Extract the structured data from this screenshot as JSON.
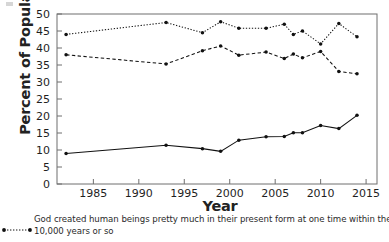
{
  "chart_data": {
    "type": "line",
    "title": "",
    "xlabel": "Year",
    "ylabel": "Percent of Population",
    "xlim": [
      1981,
      2016.2
    ],
    "ylim": [
      0,
      50
    ],
    "xticks": [
      1985,
      1990,
      1995,
      2000,
      2005,
      2010,
      2015
    ],
    "yticks": [
      0,
      5,
      10,
      15,
      20,
      25,
      30,
      35,
      40,
      45,
      50
    ],
    "grid": false,
    "legend_position": "below-left",
    "series": [
      {
        "name": "God created human beings pretty much in their present form at one time within the last 10,000 years or so",
        "style": "dotted",
        "marker": "filled-circle",
        "color": "#111111",
        "x": [
          1982,
          1993,
          1997,
          1999,
          2001,
          2004,
          2006,
          2007,
          2008,
          2010,
          2012,
          2014
        ],
        "values": [
          44.0,
          47.5,
          44.5,
          47.7,
          45.8,
          45.8,
          47.0,
          44.0,
          45.0,
          41.2,
          47.2,
          43.3
        ]
      },
      {
        "name": "Human beings have developed over millions of years from less advanced forms of life, but God guided this process",
        "style": "dashed",
        "marker": "filled-circle",
        "color": "#111111",
        "x": [
          1982,
          1993,
          1997,
          1999,
          2001,
          2004,
          2006,
          2007,
          2008,
          2010,
          2012,
          2014
        ],
        "values": [
          38.0,
          35.3,
          39.2,
          40.6,
          37.9,
          38.8,
          36.9,
          38.2,
          37.1,
          39.0,
          33.1,
          32.4
        ]
      },
      {
        "name": "Human beings have developed over millions of years from less advanced forms of life, but God had no part in this process",
        "style": "solid",
        "marker": "filled-circle",
        "color": "#111111",
        "x": [
          1982,
          1993,
          1997,
          1999,
          2001,
          2004,
          2006,
          2007,
          2008,
          2010,
          2012,
          2014
        ],
        "values": [
          9.0,
          11.4,
          10.4,
          9.6,
          12.9,
          13.9,
          14.0,
          15.1,
          15.1,
          17.2,
          16.3,
          20.2
        ]
      }
    ]
  },
  "axes": {
    "x_title": "Year",
    "y_title": "Percent of Population",
    "x_tick_labels": [
      "1985",
      "1990",
      "1995",
      "2000",
      "2005",
      "2010",
      "2015"
    ],
    "y_tick_labels": [
      "0",
      "5",
      "10",
      "15",
      "20",
      "25",
      "30",
      "35",
      "40",
      "45",
      "50"
    ]
  },
  "legend": {
    "marker_style": "dotted-line-with-endpoint-dots",
    "entry_line_1": "God created human beings pretty much in their present form at one time within the last",
    "entry_line_2": "10,000 years or so"
  }
}
